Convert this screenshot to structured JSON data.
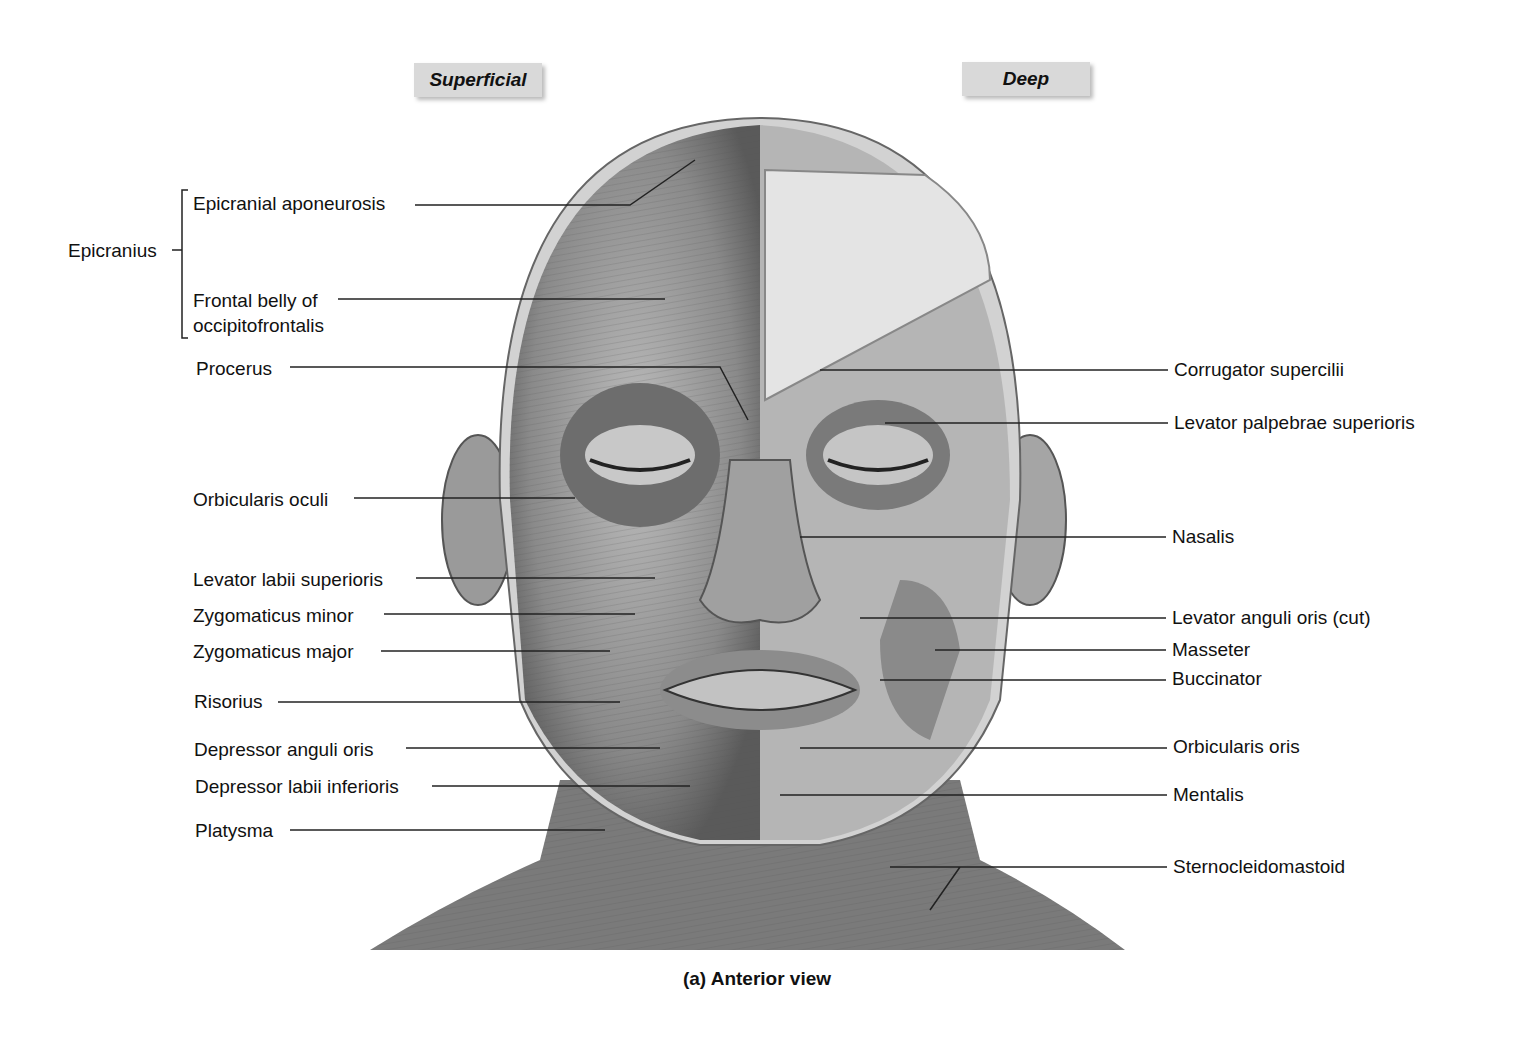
{
  "headers": {
    "superficial": "Superficial",
    "deep": "Deep"
  },
  "caption": "(a) Anterior view",
  "group_label": "Epicranius",
  "left_labels": [
    {
      "text": "Epicranial aponeurosis",
      "x": 193,
      "y": 193
    },
    {
      "text": "Frontal belly of",
      "x": 193,
      "y": 290
    },
    {
      "text": "occipitofrontalis",
      "x": 193,
      "y": 315
    },
    {
      "text": "Procerus",
      "x": 196,
      "y": 358
    },
    {
      "text": "Orbicularis oculi",
      "x": 193,
      "y": 489
    },
    {
      "text": "Levator labii superioris",
      "x": 193,
      "y": 569
    },
    {
      "text": "Zygomaticus minor",
      "x": 193,
      "y": 605
    },
    {
      "text": "Zygomaticus major",
      "x": 193,
      "y": 641
    },
    {
      "text": "Risorius",
      "x": 194,
      "y": 691
    },
    {
      "text": "Depressor anguli oris",
      "x": 194,
      "y": 739
    },
    {
      "text": "Depressor labii inferioris",
      "x": 195,
      "y": 776
    },
    {
      "text": "Platysma",
      "x": 195,
      "y": 820
    }
  ],
  "right_labels": [
    {
      "text": "Corrugator supercilii",
      "x": 1174,
      "y": 359
    },
    {
      "text": "Levator palpebrae superioris",
      "x": 1174,
      "y": 412
    },
    {
      "text": "Nasalis",
      "x": 1172,
      "y": 526
    },
    {
      "text": "Levator anguli oris (cut)",
      "x": 1172,
      "y": 607
    },
    {
      "text": "Masseter",
      "x": 1172,
      "y": 639
    },
    {
      "text": "Buccinator",
      "x": 1172,
      "y": 668
    },
    {
      "text": "Orbicularis oris",
      "x": 1173,
      "y": 736
    },
    {
      "text": "Mentalis",
      "x": 1173,
      "y": 784
    },
    {
      "text": "Sternocleidomastoid",
      "x": 1173,
      "y": 856
    }
  ]
}
